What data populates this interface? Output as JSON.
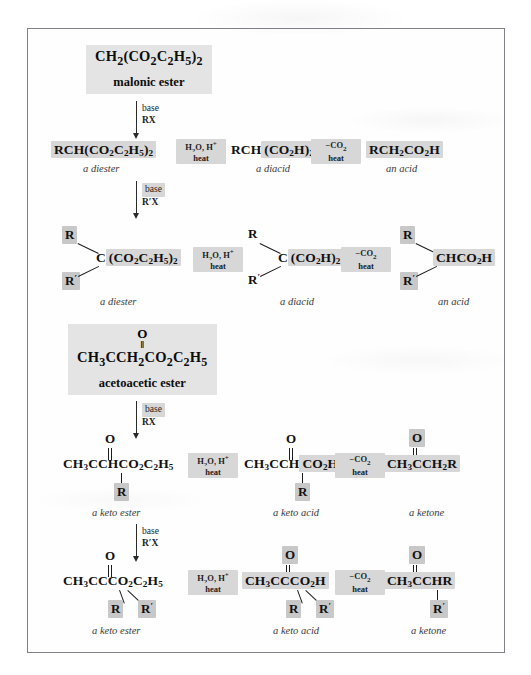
{
  "page": {
    "background_color": "#ffffff",
    "frame_border_color": "#7e8186",
    "highlight_color": "#c8c8c8"
  },
  "sections": [
    {
      "id": "malonic",
      "header": {
        "formula": "CH2(CO2C2H5)2",
        "formula_parts": [
          "CH",
          "2",
          "(CO",
          "2",
          "C",
          "2",
          "H",
          "5",
          ")",
          "2"
        ],
        "name": "malonic ester"
      }
    },
    {
      "id": "acetoacetic",
      "header": {
        "carbonyl_o": "O",
        "double_bond": "‖",
        "formula": "CH3CCH2CO2C2H5",
        "name": "acetoacetic ester"
      }
    }
  ],
  "vertical_arrows": [
    {
      "id": "malonic-mono",
      "line1": "base",
      "line2": "RX"
    },
    {
      "id": "malonic-di",
      "line1": "base",
      "line2": "R′X"
    },
    {
      "id": "acetoacetic-mono",
      "line1": "base",
      "line2": "RX"
    },
    {
      "id": "acetoacetic-di",
      "line1": "base",
      "line2": "R′X"
    }
  ],
  "horizontal_arrows": {
    "hydrolysis": {
      "top": "H2O, H+",
      "bottom": "heat"
    },
    "decarboxylation": {
      "top": "−CO2",
      "bottom": "heat"
    }
  },
  "rows": [
    {
      "id": "row1-malonic-mono",
      "steps": [
        {
          "formula": "RCH(CO2C2H5)2",
          "caption": "a diester"
        },
        {
          "formula": "RCH(CO2H)2",
          "caption": "a diacid"
        },
        {
          "formula": "RCH2CO2H",
          "caption": "an acid"
        }
      ]
    },
    {
      "id": "row2-malonic-di",
      "steps": [
        {
          "formula": "C(CO2C2H5)2",
          "r_top": "R",
          "r_bottom": "R′",
          "caption": "a diester"
        },
        {
          "formula": "C(CO2H)2",
          "r_top": "R",
          "r_bottom": "R′",
          "caption": "a diacid"
        },
        {
          "formula": "CHCO2H",
          "r_top": "R",
          "r_bottom": "R′",
          "caption": "an acid"
        }
      ]
    },
    {
      "id": "row3-acetoacetic-mono",
      "steps": [
        {
          "formula": "CH3CCHCO2C2H5",
          "carbonyl_o": "O",
          "r_bottom": "R",
          "caption": "a keto ester"
        },
        {
          "formula": "CH3CCHCO2H",
          "carbonyl_o": "O",
          "r_bottom": "R",
          "caption": "a keto acid"
        },
        {
          "formula": "CH3CCH2R",
          "carbonyl_o": "O",
          "r_bottom": "",
          "caption": "a ketone"
        }
      ]
    },
    {
      "id": "row4-acetoacetic-di",
      "steps": [
        {
          "formula": "CH3CCCO2C2H5",
          "carbonyl_o": "O",
          "r_left": "R",
          "r_right": "R′",
          "caption": "a keto ester"
        },
        {
          "formula": "CH3CCCO2H",
          "carbonyl_o": "O",
          "r_left": "R",
          "r_right": "R′",
          "caption": "a keto acid"
        },
        {
          "formula": "CH3CCHR",
          "carbonyl_o": "O",
          "r_bottom": "R′",
          "caption": "a ketone"
        }
      ]
    }
  ],
  "labels": {
    "a_diester": "a diester",
    "a_diacid": "a diacid",
    "an_acid": "an acid",
    "a_keto_ester": "a keto ester",
    "a_keto_acid": "a keto acid",
    "a_ketone": "a ketone",
    "heat": "heat",
    "base": "base"
  }
}
